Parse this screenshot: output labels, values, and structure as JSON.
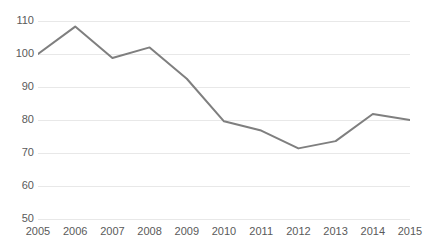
{
  "chart_data": {
    "type": "line",
    "title": "",
    "xlabel": "",
    "ylabel": "",
    "categories": [
      "2005",
      "2006",
      "2007",
      "2008",
      "2009",
      "2010",
      "2011",
      "2012",
      "2013",
      "2014",
      "2015"
    ],
    "values": [
      100.0,
      108.3,
      98.8,
      102.0,
      92.5,
      79.6,
      76.8,
      71.4,
      73.6,
      81.8,
      80.0
    ],
    "series": [
      {
        "name": "",
        "values": [
          100.0,
          108.3,
          98.8,
          102.0,
          92.5,
          79.6,
          76.8,
          71.4,
          73.6,
          81.8,
          80.0
        ]
      }
    ],
    "ylim": [
      50,
      110
    ],
    "yticks": [
      50,
      60,
      70,
      80,
      90,
      100,
      110
    ],
    "ytick_labels": [
      "50",
      "60",
      "70",
      "80",
      "90",
      "100",
      "110"
    ],
    "xtick_labels": [
      "2005",
      "2006",
      "2007",
      "2008",
      "2009",
      "2010",
      "2011",
      "2012",
      "2013",
      "2014",
      "2015"
    ],
    "grid": true,
    "grid_axis": "y",
    "legend": false,
    "legend_position": "none",
    "line_color": "#7f7f7f",
    "grid_color": "#e8e8e8",
    "tick_label_color": "#5a5a5a",
    "background_color": "#ffffff",
    "line_width": 2,
    "markers": false
  }
}
